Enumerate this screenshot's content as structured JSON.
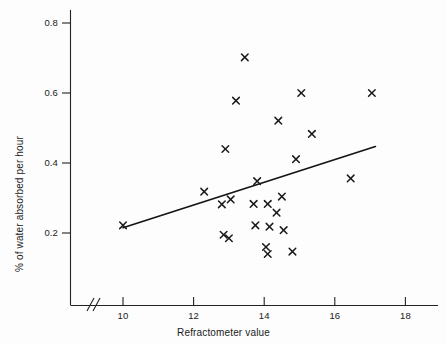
{
  "chart_data": {
    "type": "scatter",
    "title": "",
    "xlabel": "Refractometer value",
    "ylabel": "% of water absorbed per hour",
    "xlim": [
      9.0,
      18.8
    ],
    "ylim": [
      0.0,
      0.86
    ],
    "xticks": [
      10,
      12,
      14,
      16,
      18
    ],
    "xtick_labels": [
      "10",
      "12",
      "14",
      "16",
      "18"
    ],
    "yticks": [
      0.2,
      0.4,
      0.6,
      0.8
    ],
    "ytick_labels": [
      "0.2",
      "0.4",
      "0.6",
      "0.8"
    ],
    "grid": false,
    "legend": null,
    "axis_break": "//",
    "axis_break_note": "x-axis break between origin and first tick at 10",
    "marker": "x",
    "marker_color": "#1a1a1a",
    "points": [
      {
        "x": 10.0,
        "y": 0.222
      },
      {
        "x": 12.3,
        "y": 0.318
      },
      {
        "x": 12.8,
        "y": 0.282
      },
      {
        "x": 12.85,
        "y": 0.195
      },
      {
        "x": 12.9,
        "y": 0.44
      },
      {
        "x": 13.0,
        "y": 0.185
      },
      {
        "x": 13.05,
        "y": 0.296
      },
      {
        "x": 13.2,
        "y": 0.578
      },
      {
        "x": 13.45,
        "y": 0.702
      },
      {
        "x": 13.7,
        "y": 0.283
      },
      {
        "x": 13.75,
        "y": 0.222
      },
      {
        "x": 13.8,
        "y": 0.348
      },
      {
        "x": 14.05,
        "y": 0.16
      },
      {
        "x": 14.1,
        "y": 0.14
      },
      {
        "x": 14.1,
        "y": 0.283
      },
      {
        "x": 14.15,
        "y": 0.218
      },
      {
        "x": 14.35,
        "y": 0.258
      },
      {
        "x": 14.4,
        "y": 0.521
      },
      {
        "x": 14.5,
        "y": 0.304
      },
      {
        "x": 14.55,
        "y": 0.208
      },
      {
        "x": 14.8,
        "y": 0.147
      },
      {
        "x": 14.9,
        "y": 0.411
      },
      {
        "x": 15.05,
        "y": 0.6
      },
      {
        "x": 15.35,
        "y": 0.483
      },
      {
        "x": 16.45,
        "y": 0.356
      },
      {
        "x": 17.05,
        "y": 0.6
      }
    ],
    "trend_line": {
      "type": "linear-fit",
      "x_start": 10.0,
      "y_start": 0.215,
      "x_end": 17.15,
      "y_end": 0.447
    }
  }
}
